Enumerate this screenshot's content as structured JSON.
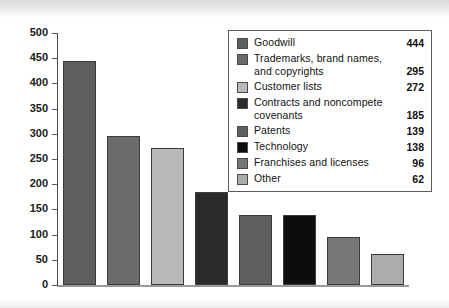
{
  "chart_data": {
    "type": "bar",
    "title": "",
    "subtitle": "",
    "xlabel": "",
    "ylabel": "",
    "ylim": [
      0,
      500
    ],
    "yticks": [
      0,
      50,
      100,
      150,
      200,
      250,
      300,
      350,
      400,
      450,
      500
    ],
    "grid": false,
    "legend_position": "top-right",
    "categories": [
      "Goodwill",
      "Trademarks, brand names, and copyrights",
      "Customer lists",
      "Contracts and noncompete covenants",
      "Patents",
      "Technology",
      "Franchises and licenses",
      "Other"
    ],
    "values": [
      444,
      295,
      272,
      185,
      139,
      138,
      96,
      62
    ],
    "colors": [
      "#5e5e5e",
      "#6b6b6b",
      "#b9b9b9",
      "#2a2a2a",
      "#5f5f5f",
      "#0d0d0d",
      "#767676",
      "#acacac"
    ]
  },
  "axis": {
    "y_tick_labels": [
      "500",
      "450",
      "400",
      "350",
      "300",
      "250",
      "200",
      "150",
      "100",
      "50",
      "0"
    ]
  },
  "legend": {
    "items": [
      {
        "label_line1": "Goodwill",
        "label_line2": "",
        "value": "444",
        "color": "#5e5e5e"
      },
      {
        "label_line1": "Trademarks, brand names,",
        "label_line2": "and copyrights",
        "value": "295",
        "color": "#6b6b6b"
      },
      {
        "label_line1": "Customer lists",
        "label_line2": "",
        "value": "272",
        "color": "#b9b9b9"
      },
      {
        "label_line1": "Contracts and noncompete",
        "label_line2": "covenants",
        "value": "185",
        "color": "#2a2a2a"
      },
      {
        "label_line1": "Patents",
        "label_line2": "",
        "value": "139",
        "color": "#5f5f5f"
      },
      {
        "label_line1": "Technology",
        "label_line2": "",
        "value": "138",
        "color": "#0d0d0d"
      },
      {
        "label_line1": "Franchises and licenses",
        "label_line2": "",
        "value": "96",
        "color": "#767676"
      },
      {
        "label_line1": "Other",
        "label_line2": "",
        "value": "62",
        "color": "#acacac"
      }
    ]
  }
}
